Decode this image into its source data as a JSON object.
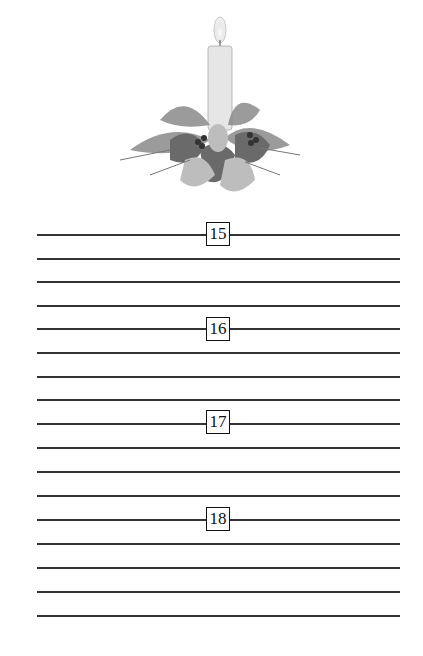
{
  "illustration": {
    "subject": "candle-with-holly-centerpiece"
  },
  "page": {
    "line_count": 17,
    "sections": [
      {
        "label": "15"
      },
      {
        "label": "16"
      },
      {
        "label": "17"
      },
      {
        "label": "18"
      }
    ]
  }
}
